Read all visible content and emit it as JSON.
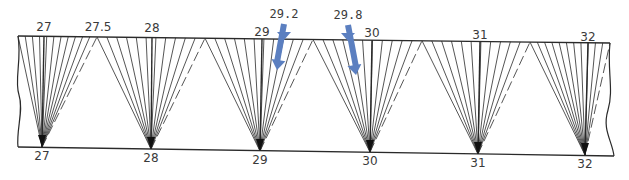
{
  "diagram": {
    "top_labels": [
      {
        "text": "27",
        "x": 44,
        "y": 31
      },
      {
        "text": "27.5",
        "x": 98,
        "y": 31
      },
      {
        "text": "28",
        "x": 152,
        "y": 32
      },
      {
        "text": "29",
        "x": 262,
        "y": 36
      },
      {
        "text": "30",
        "x": 372,
        "y": 37
      },
      {
        "text": "31",
        "x": 480,
        "y": 39
      },
      {
        "text": "32",
        "x": 588,
        "y": 41
      }
    ],
    "bottom_labels": [
      {
        "text": "27",
        "x": 42,
        "y": 160
      },
      {
        "text": "28",
        "x": 151,
        "y": 162
      },
      {
        "text": "29",
        "x": 260,
        "y": 164
      },
      {
        "text": "30",
        "x": 370,
        "y": 165
      },
      {
        "text": "31",
        "x": 478,
        "y": 167
      },
      {
        "text": "32",
        "x": 585,
        "y": 168
      }
    ],
    "highlight_labels": [
      {
        "text": "29.2",
        "x": 284,
        "y": 18
      },
      {
        "text": "29.8",
        "x": 348,
        "y": 19
      }
    ],
    "arrow_color": "#5b7fc0",
    "line_color": "#2a2a2a",
    "fans": [
      {
        "apex": [
          42,
          147
        ],
        "top_left": 18,
        "center": 44,
        "top_right": 97
      },
      {
        "apex": [
          151,
          149
        ],
        "top_left": 97,
        "center": 152,
        "top_right": 205
      },
      {
        "apex": [
          260,
          151
        ],
        "top_left": 205,
        "center": 262,
        "top_right": 313
      },
      {
        "apex": [
          370,
          152
        ],
        "top_left": 313,
        "center": 372,
        "top_right": 422
      },
      {
        "apex": [
          478,
          154
        ],
        "top_left": 422,
        "center": 480,
        "top_right": 530
      },
      {
        "apex": [
          585,
          155
        ],
        "top_left": 530,
        "center": 588,
        "top_right": 610
      }
    ],
    "frame": {
      "top_y_left": 36,
      "top_y_right": 43,
      "bottom_y_left": 147,
      "bottom_y_right": 156,
      "x_left": 18,
      "x_right": 610
    }
  }
}
